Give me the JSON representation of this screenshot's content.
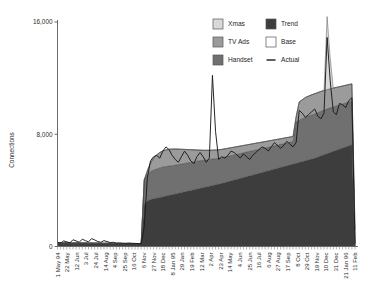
{
  "chart_data": {
    "type": "area",
    "title": "",
    "subtitle": "",
    "xlabel": "",
    "ylabel": "Connections",
    "ylim": [
      0,
      16000
    ],
    "yticks": [
      0,
      8000,
      16000
    ],
    "ytick_labels": [
      "0",
      "8,000",
      "16,000"
    ],
    "grid": false,
    "legend_position": "top-right",
    "stacked": true,
    "legend": [
      {
        "label": "Xmas",
        "color": "#d9d9d9",
        "type": "area"
      },
      {
        "label": "Trend",
        "color": "#3d3d3d",
        "type": "area"
      },
      {
        "label": "TV Ads",
        "color": "#9b9b9b",
        "type": "area"
      },
      {
        "label": "Base",
        "color": "#ffffff",
        "type": "area"
      },
      {
        "label": "Handset",
        "color": "#707070",
        "type": "area"
      },
      {
        "label": "Actual",
        "color": "#1a1a1a",
        "type": "line"
      }
    ],
    "xtick_labels": [
      "1 May 94",
      "22 May",
      "12 Jun",
      "3 Jul",
      "24 Jul",
      "14 Aug",
      "4 Sep",
      "25 Sep",
      "16 Oct",
      "6 Nov",
      "27 Nov",
      "18 Dec",
      "8 Jan 95",
      "29 Jan",
      "19 Feb",
      "12 Mar",
      "2 Apr",
      "23 Apr",
      "14 May",
      "4 Jun",
      "25 Jun",
      "16 Jul",
      "6 Aug",
      "27 Aug",
      "17 Sep",
      "8 Oct",
      "29 Oct",
      "19 Nov",
      "10 Dec",
      "31 Dec",
      "21 Jan 96",
      "11 Feb"
    ],
    "x_index": [
      0,
      1,
      2,
      3,
      4,
      5,
      6,
      7,
      8,
      9,
      10,
      11,
      12,
      13,
      14,
      15,
      16,
      17,
      18,
      19,
      20,
      21,
      22,
      23,
      24,
      25,
      26,
      27,
      28,
      29,
      30,
      31,
      32,
      33,
      34,
      35,
      36,
      37,
      38,
      39,
      40,
      41,
      42,
      43,
      44,
      45,
      46,
      47,
      48,
      49,
      50,
      51,
      52,
      53,
      54,
      55,
      56,
      57,
      58,
      59,
      60,
      61,
      62,
      63,
      64,
      65,
      66,
      67,
      68,
      69,
      70,
      71,
      72,
      73,
      74,
      75,
      76,
      77,
      78,
      79,
      80,
      81,
      82,
      83,
      84,
      85,
      86,
      87,
      88,
      89,
      90,
      91,
      92,
      93,
      94,
      95,
      96
    ],
    "series": [
      {
        "name": "Base",
        "color": "#ffffff",
        "values": [
          0,
          0,
          0,
          0,
          0,
          0,
          0,
          0,
          0,
          0,
          0,
          0,
          0,
          0,
          0,
          0,
          0,
          0,
          0,
          0,
          0,
          0,
          0,
          0,
          0,
          0,
          0,
          0,
          0,
          0,
          0,
          0,
          0,
          0,
          0,
          0,
          0,
          0,
          0,
          0,
          0,
          0,
          0,
          0,
          0,
          0,
          0,
          0,
          0,
          0,
          0,
          0,
          0,
          0,
          0,
          0,
          0,
          0,
          0,
          0,
          0,
          0,
          0,
          0,
          0,
          0,
          0,
          0,
          0,
          0,
          0,
          0,
          0,
          0,
          0,
          0,
          0,
          0,
          0,
          0,
          0,
          0,
          0,
          0,
          0,
          0,
          0,
          0,
          0,
          0,
          0,
          0,
          0,
          0,
          0,
          0,
          0
        ]
      },
      {
        "name": "Trend",
        "color": "#3d3d3d",
        "values": [
          260,
          250,
          255,
          265,
          250,
          245,
          255,
          250,
          245,
          250,
          240,
          245,
          235,
          240,
          230,
          225,
          230,
          225,
          220,
          215,
          215,
          210,
          205,
          210,
          205,
          205,
          200,
          200,
          3050,
          3250,
          3350,
          3400,
          3450,
          3500,
          3550,
          3600,
          3650,
          3700,
          3750,
          3800,
          3850,
          3900,
          3950,
          4000,
          4050,
          4100,
          4150,
          4200,
          4250,
          4300,
          4350,
          4400,
          4450,
          4500,
          4560,
          4620,
          4680,
          4740,
          4800,
          4860,
          4920,
          4980,
          5040,
          5100,
          5160,
          5220,
          5280,
          5340,
          5400,
          5460,
          5520,
          5580,
          5640,
          5700,
          5760,
          5820,
          5880,
          5940,
          6000,
          6060,
          6120,
          6180,
          6240,
          6300,
          6380,
          6460,
          6540,
          6620,
          6700,
          6780,
          6860,
          6940,
          7020,
          7100,
          7180,
          7260,
          0
        ]
      },
      {
        "name": "Handset",
        "color": "#707070",
        "values": [
          0,
          0,
          0,
          0,
          0,
          0,
          0,
          0,
          0,
          0,
          0,
          0,
          0,
          0,
          0,
          0,
          0,
          0,
          0,
          0,
          0,
          0,
          0,
          0,
          0,
          0,
          0,
          0,
          1700,
          1900,
          2000,
          2050,
          2080,
          2100,
          2120,
          2100,
          2080,
          2060,
          2050,
          2040,
          2030,
          2020,
          2010,
          2000,
          1990,
          1980,
          1960,
          1940,
          1920,
          1900,
          1880,
          1860,
          1840,
          1830,
          1820,
          1810,
          1800,
          1790,
          1780,
          1770,
          1760,
          1750,
          1740,
          1730,
          1720,
          1710,
          1700,
          1690,
          1680,
          1670,
          1660,
          1650,
          1640,
          1630,
          1620,
          1610,
          1600,
          2950,
          3000,
          3050,
          3100,
          3120,
          3140,
          3150,
          3160,
          3170,
          3180,
          3190,
          3180,
          3170,
          3160,
          3150,
          3140,
          3130,
          3120,
          3110,
          0
        ]
      },
      {
        "name": "TV Ads",
        "color": "#9b9b9b",
        "values": [
          0,
          0,
          0,
          0,
          0,
          0,
          0,
          0,
          0,
          0,
          0,
          0,
          0,
          0,
          0,
          0,
          0,
          0,
          0,
          0,
          0,
          0,
          0,
          0,
          0,
          0,
          0,
          0,
          0,
          250,
          600,
          850,
          1000,
          1100,
          1150,
          1180,
          1200,
          1180,
          1150,
          1100,
          1050,
          1000,
          950,
          900,
          850,
          800,
          760,
          720,
          690,
          660,
          640,
          620,
          600,
          590,
          580,
          570,
          560,
          550,
          540,
          530,
          520,
          510,
          500,
          490,
          480,
          470,
          460,
          450,
          440,
          430,
          420,
          410,
          400,
          390,
          380,
          370,
          360,
          350,
          1300,
          1350,
          1400,
          1420,
          1430,
          1440,
          1430,
          1420,
          1400,
          1380,
          1360,
          1340,
          1320,
          1300,
          1280,
          1260,
          1240,
          1220,
          1200,
          0
        ]
      },
      {
        "name": "Xmas",
        "color": "#d9d9d9",
        "values": [
          0,
          0,
          0,
          0,
          0,
          0,
          0,
          0,
          0,
          0,
          0,
          0,
          0,
          0,
          0,
          0,
          0,
          0,
          0,
          0,
          0,
          0,
          0,
          0,
          0,
          0,
          0,
          0,
          0,
          0,
          0,
          0,
          0,
          0,
          0,
          0,
          0,
          0,
          0,
          0,
          0,
          0,
          0,
          0,
          0,
          0,
          0,
          0,
          0,
          0,
          0,
          0,
          0,
          0,
          0,
          0,
          0,
          0,
          0,
          0,
          0,
          0,
          0,
          0,
          0,
          0,
          0,
          0,
          0,
          0,
          0,
          0,
          0,
          0,
          0,
          0,
          0,
          0,
          0,
          0,
          0,
          0,
          0,
          0,
          0,
          0,
          0,
          5200,
          2200,
          0,
          0,
          0,
          0,
          0,
          0,
          0,
          0
        ]
      }
    ],
    "actual": {
      "name": "Actual",
      "color": "#1a1a1a",
      "values": [
        300,
        250,
        400,
        330,
        260,
        480,
        400,
        300,
        520,
        420,
        330,
        560,
        470,
        350,
        300,
        420,
        350,
        280,
        300,
        250,
        260,
        240,
        230,
        250,
        230,
        220,
        210,
        200,
        1400,
        4900,
        6100,
        6400,
        6500,
        6300,
        6800,
        7100,
        6900,
        6500,
        6200,
        6000,
        6400,
        6800,
        6500,
        6100,
        5900,
        6400,
        6700,
        6400,
        6000,
        6300,
        12200,
        8200,
        6200,
        6400,
        6300,
        6500,
        6800,
        6700,
        6500,
        6300,
        6600,
        6400,
        6200,
        6500,
        6700,
        6900,
        7100,
        7000,
        6800,
        7100,
        7400,
        7200,
        7000,
        7200,
        7500,
        7300,
        7100,
        7400,
        9700,
        9500,
        9200,
        9400,
        9600,
        9800,
        9300,
        9100,
        9500,
        14900,
        11800,
        9600,
        9400,
        10200,
        10100,
        9900,
        10400,
        10600,
        200
      ]
    }
  },
  "axis": {
    "y_axis_label": "Connections"
  }
}
